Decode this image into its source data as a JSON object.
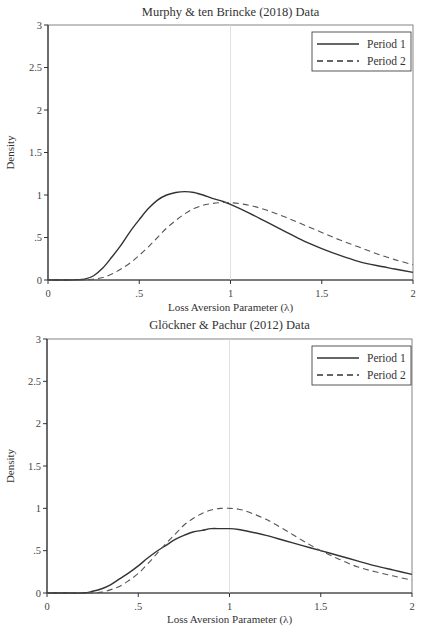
{
  "chart_data": [
    {
      "type": "line",
      "title": "Murphy & ten Brincke (2018) Data",
      "xlabel": "Loss Aversion Parameter (λ)",
      "ylabel": "Density",
      "xlim": [
        0,
        2
      ],
      "ylim": [
        0,
        3
      ],
      "xticks": [
        0,
        0.5,
        1,
        1.5,
        2
      ],
      "xtick_labels": [
        "0",
        ".5",
        "1",
        "1.5",
        "2"
      ],
      "yticks": [
        0,
        0.5,
        1,
        1.5,
        2,
        2.5,
        3
      ],
      "ytick_labels": [
        "0",
        ".5",
        "1",
        "1.5",
        "2",
        "2.5",
        "3"
      ],
      "reference_line_x": 1,
      "legend_position": "upper right",
      "grid": false,
      "x": [
        0,
        0.1,
        0.2,
        0.25,
        0.3,
        0.35,
        0.4,
        0.45,
        0.5,
        0.55,
        0.6,
        0.65,
        0.7,
        0.75,
        0.8,
        0.85,
        0.9,
        0.95,
        1.0,
        1.1,
        1.2,
        1.3,
        1.4,
        1.5,
        1.6,
        1.7,
        1.8,
        1.9,
        2.0
      ],
      "series": [
        {
          "name": "Period 1",
          "style": "solid",
          "values": [
            0,
            0,
            0.01,
            0.05,
            0.14,
            0.27,
            0.41,
            0.57,
            0.71,
            0.84,
            0.94,
            1.0,
            1.03,
            1.04,
            1.03,
            1.0,
            0.96,
            0.93,
            0.89,
            0.79,
            0.68,
            0.57,
            0.46,
            0.37,
            0.29,
            0.22,
            0.17,
            0.13,
            0.09
          ]
        },
        {
          "name": "Period 2",
          "style": "dashed",
          "values": [
            0,
            0,
            0,
            0.01,
            0.03,
            0.07,
            0.13,
            0.2,
            0.29,
            0.39,
            0.5,
            0.61,
            0.7,
            0.78,
            0.84,
            0.88,
            0.9,
            0.91,
            0.91,
            0.88,
            0.82,
            0.74,
            0.65,
            0.56,
            0.47,
            0.39,
            0.31,
            0.24,
            0.18
          ]
        }
      ]
    },
    {
      "type": "line",
      "title": "Glöckner & Pachur (2012) Data",
      "xlabel": "Loss Aversion Parameter (λ)",
      "ylabel": "Density",
      "xlim": [
        0,
        2
      ],
      "ylim": [
        0,
        3
      ],
      "xticks": [
        0,
        0.5,
        1,
        1.5,
        2
      ],
      "xtick_labels": [
        "0",
        ".5",
        "1",
        "1.5",
        "2"
      ],
      "yticks": [
        0,
        0.5,
        1,
        1.5,
        2,
        2.5,
        3
      ],
      "ytick_labels": [
        "0",
        ".5",
        "1",
        "1.5",
        "2",
        "2.5",
        "3"
      ],
      "reference_line_x": 1,
      "legend_position": "upper right",
      "grid": false,
      "x": [
        0,
        0.1,
        0.2,
        0.25,
        0.3,
        0.35,
        0.4,
        0.45,
        0.5,
        0.55,
        0.6,
        0.65,
        0.7,
        0.75,
        0.8,
        0.85,
        0.9,
        0.95,
        1.0,
        1.05,
        1.1,
        1.2,
        1.3,
        1.4,
        1.5,
        1.6,
        1.7,
        1.8,
        1.9,
        2.0
      ],
      "series": [
        {
          "name": "Period 1",
          "style": "solid",
          "values": [
            0,
            0,
            0.0,
            0.02,
            0.05,
            0.1,
            0.17,
            0.24,
            0.32,
            0.41,
            0.49,
            0.56,
            0.63,
            0.68,
            0.72,
            0.74,
            0.76,
            0.76,
            0.76,
            0.75,
            0.73,
            0.68,
            0.62,
            0.56,
            0.5,
            0.44,
            0.38,
            0.32,
            0.27,
            0.22
          ]
        },
        {
          "name": "Period 2",
          "style": "dashed",
          "values": [
            0,
            0,
            0,
            0.0,
            0.01,
            0.04,
            0.08,
            0.15,
            0.23,
            0.34,
            0.46,
            0.58,
            0.69,
            0.8,
            0.88,
            0.94,
            0.98,
            1.0,
            1.0,
            0.99,
            0.96,
            0.87,
            0.75,
            0.62,
            0.5,
            0.4,
            0.31,
            0.25,
            0.2,
            0.15
          ]
        }
      ]
    }
  ],
  "legend": {
    "period1": "Period 1",
    "period2": "Period 2"
  }
}
